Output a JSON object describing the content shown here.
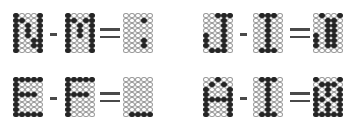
{
  "grid": {
    "cols": 5,
    "rows": 8,
    "on_color": "#262626",
    "off_border": "#9a9a9a"
  },
  "equations": [
    {
      "id": "n-m",
      "operand1": {
        "letter": "N",
        "pattern": [
          "10001",
          "11001",
          "10101",
          "10101",
          "10101",
          "10011",
          "10011",
          "10001"
        ]
      },
      "operator": "minus",
      "operand2": {
        "letter": "M",
        "pattern": [
          "10001",
          "11011",
          "10101",
          "10101",
          "10101",
          "10001",
          "10001",
          "10001"
        ]
      },
      "result": {
        "pattern": [
          "00000",
          "00010",
          "00000",
          "00000",
          "00000",
          "00010",
          "00010",
          "00000"
        ]
      },
      "notes": "Result read directly (dots at col 4 in rows 2 and 7); N and M patterns approximated to fit."
    },
    {
      "id": "j-i",
      "operand1": {
        "letter": "J",
        "pattern": [
          "00111",
          "00010",
          "00010",
          "00010",
          "10010",
          "10010",
          "10010",
          "01110"
        ]
      },
      "operator": "minus",
      "operand2": {
        "letter": "I",
        "pattern": [
          "01110",
          "00100",
          "00100",
          "00100",
          "00100",
          "00100",
          "00100",
          "01110"
        ]
      },
      "result": {
        "pattern": [
          "01001",
          "00110",
          "00110",
          "00110",
          "10110",
          "10110",
          "10110",
          "00000"
        ]
      },
      "notes": "All three grids read directly from zoomed crops."
    },
    {
      "id": "e-f",
      "operand1": {
        "letter": "E",
        "pattern": [
          "11111",
          "10000",
          "10000",
          "11110",
          "10000",
          "10000",
          "10000",
          "11111"
        ]
      },
      "operator": "minus",
      "operand2": {
        "letter": "F",
        "pattern": [
          "11111",
          "10000",
          "10000",
          "11110",
          "10000",
          "10000",
          "10000",
          "10000"
        ]
      },
      "result": {
        "pattern": [
          "00000",
          "00000",
          "00000",
          "00000",
          "00000",
          "00000",
          "00000",
          "01111"
        ]
      },
      "notes": "All three grids read directly; result is E's bottom row minus F's col 1."
    },
    {
      "id": "a-i",
      "operand1": {
        "letter": "A",
        "pattern": [
          "00100",
          "01010",
          "10001",
          "10001",
          "11111",
          "10001",
          "10001",
          "10001"
        ]
      },
      "operator": "minus",
      "operand2": {
        "letter": "I",
        "pattern": [
          "01110",
          "00100",
          "00100",
          "00100",
          "00100",
          "00100",
          "00100",
          "01110"
        ]
      },
      "result": {
        "pattern": [
          "10001",
          "01110",
          "10101",
          "10101",
          "11011",
          "10101",
          "10101",
          "11111"
        ]
      },
      "notes": "A and the result approximated; the result grid is too dense to read cell-by-cell at this resolution."
    }
  ]
}
